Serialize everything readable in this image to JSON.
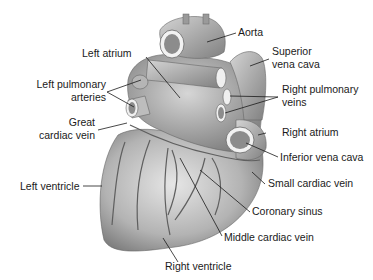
{
  "diagram": {
    "labels": {
      "aorta": "Aorta",
      "superior_vena_cava_1": "Superior",
      "superior_vena_cava_2": "vena cava",
      "left_atrium": "Left atrium",
      "left_pulmonary_arteries_1": "Left pulmonary",
      "left_pulmonary_arteries_2": "arteries",
      "right_pulmonary_veins_1": "Right pulmonary",
      "right_pulmonary_veins_2": "veins",
      "great_cardiac_vein_1": "Great",
      "great_cardiac_vein_2": "cardiac vein",
      "right_atrium": "Right atrium",
      "inferior_vena_cava": "Inferior vena cava",
      "small_cardiac_vein": "Small cardiac vein",
      "left_ventricle": "Left ventricle",
      "coronary_sinus": "Coronary sinus",
      "middle_cardiac_vein": "Middle cardiac vein",
      "right_ventricle": "Right ventricle"
    },
    "colors": {
      "tissue_light": "#d9d9d9",
      "tissue_mid": "#a6a6a6",
      "tissue_dark": "#6e6e6e",
      "vessel": "#5a5a5a",
      "leader": "#1a1a1a"
    }
  }
}
